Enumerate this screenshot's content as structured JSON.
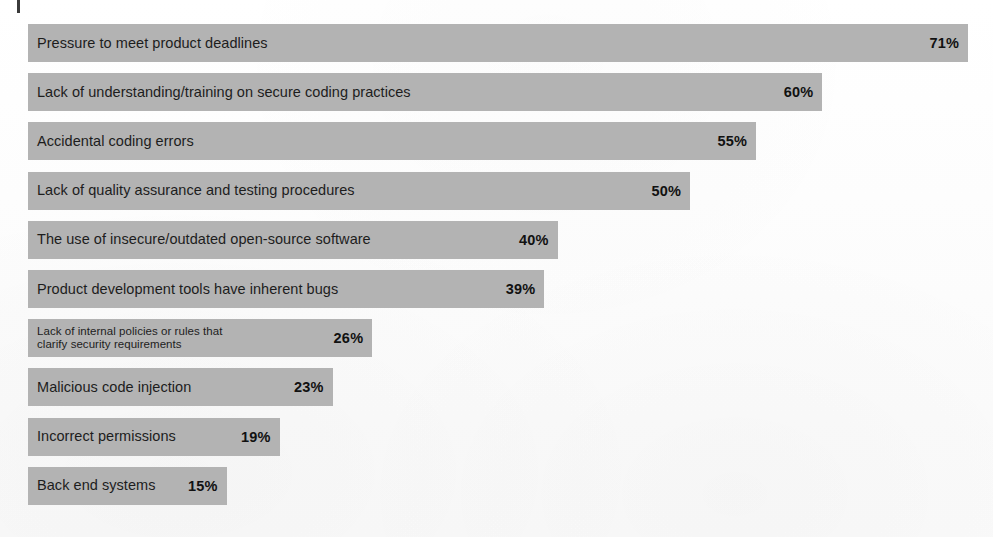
{
  "chart_data": {
    "type": "bar",
    "orientation": "horizontal",
    "title": "",
    "subtitle": "",
    "xlabel": "",
    "ylabel": "",
    "xlim": [
      0,
      71
    ],
    "grid": false,
    "legend": null,
    "value_suffix": "%",
    "value_label_position": "inside-right",
    "categories": [
      "Pressure to meet product deadlines",
      "Lack of understanding/training on secure coding practices",
      "Accidental coding errors",
      "Lack of quality assurance and testing procedures",
      "The use of insecure/outdated open-source software",
      "Product development tools have inherent bugs",
      "Lack of internal policies or rules that clarify security requirements",
      "Malicious code injection",
      "Incorrect permissions",
      "Back end systems"
    ],
    "values": [
      71,
      60,
      55,
      50,
      40,
      39,
      26,
      23,
      19,
      15
    ],
    "value_labels": [
      "71%",
      "60%",
      "55%",
      "50%",
      "40%",
      "39%",
      "26%",
      "23%",
      "19%",
      "15%"
    ]
  },
  "colors": {
    "bar_fill": "#b3b3b3",
    "page_background": "#fdfdfd",
    "label_text": "#1d1d1d",
    "value_text": "#111111",
    "crop_mark": "#3a3a3a"
  },
  "bars": [
    {
      "label": "Pressure to meet product deadlines",
      "value_label": "71%",
      "value": 71,
      "compact": false
    },
    {
      "label": "Lack of understanding/training on secure coding practices",
      "value_label": "60%",
      "value": 60,
      "compact": false
    },
    {
      "label": "Accidental coding errors",
      "value_label": "55%",
      "value": 55,
      "compact": false
    },
    {
      "label": "Lack of quality assurance and testing procedures",
      "value_label": "50%",
      "value": 50,
      "compact": false
    },
    {
      "label": "The use of insecure/outdated open-source software",
      "value_label": "40%",
      "value": 40,
      "compact": false
    },
    {
      "label": "Product development tools have inherent bugs",
      "value_label": "39%",
      "value": 39,
      "compact": false
    },
    {
      "label": "Lack of internal policies or rules that\nclarify security requirements",
      "value_label": "26%",
      "value": 26,
      "compact": true
    },
    {
      "label": "Malicious code injection",
      "value_label": "23%",
      "value": 23,
      "compact": false
    },
    {
      "label": "Incorrect permissions",
      "value_label": "19%",
      "value": 19,
      "compact": false
    },
    {
      "label": "Back end systems",
      "value_label": "15%",
      "value": 15,
      "compact": false
    }
  ],
  "layout": {
    "bar_left_px": 28,
    "bar_height_px": 38,
    "row_pitch_px": 49.2,
    "first_row_top_px": 24,
    "px_per_percent": 13.24
  }
}
